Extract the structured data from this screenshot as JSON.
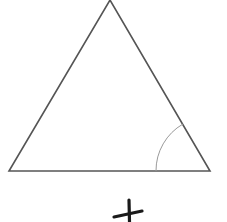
{
  "diagram": {
    "type": "geometry",
    "shape": "equilateral-triangle",
    "stroke_color": "#555555",
    "arc_color": "#9a9a9a",
    "mark_color": "#1a1a1a",
    "vertices": {
      "apex": [
        110,
        0
      ],
      "bottom_left": [
        9,
        171
      ],
      "bottom_right": [
        210,
        171
      ]
    },
    "angle_marker": {
      "vertex": "bottom_right",
      "radius": 54
    },
    "cross_mark": {
      "symbol": "+",
      "center": [
        129,
        214
      ]
    }
  }
}
